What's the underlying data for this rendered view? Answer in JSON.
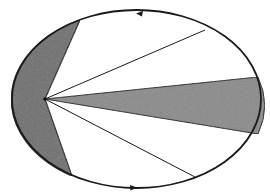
{
  "diagram": {
    "type": "kepler-second-law-orbit",
    "orbit": {
      "cx": 136.5,
      "cy": 99,
      "rx": 124.5,
      "ry": 89,
      "stroke": "#1a1a1a"
    },
    "focus": {
      "x": 45,
      "y": 99
    },
    "sectors": [
      {
        "id": "near-sector",
        "from": [
          80,
          20
        ],
        "to": [
          72,
          176
        ],
        "via": "left-arc",
        "fill": "#6e6e6e"
      },
      {
        "id": "far-sector",
        "from": [
          258,
          77
        ],
        "to": [
          258,
          134
        ],
        "via": "right-arc",
        "fill": "#8a8a8a"
      }
    ],
    "radius_lines": [
      {
        "id": "upper-radius",
        "to": [
          205,
          30
        ]
      },
      {
        "id": "lower-radius",
        "to": [
          195,
          177
        ]
      }
    ],
    "direction_arrows": [
      {
        "id": "top-arrow",
        "x": 140,
        "y": 14,
        "direction": "left"
      },
      {
        "id": "bottom-arrow",
        "x": 133,
        "y": 186,
        "direction": "right"
      }
    ]
  }
}
